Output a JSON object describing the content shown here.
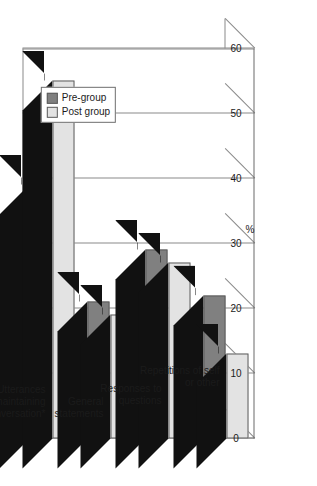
{
  "chart_data": {
    "type": "bar",
    "title": "",
    "subtitle": "",
    "xlabel": "",
    "ylabel": "%",
    "ylim": [
      0,
      60
    ],
    "yticks": [
      0,
      10,
      20,
      30,
      40,
      50,
      60
    ],
    "grid": true,
    "orientation": "rotated-90ccw",
    "legend_position": "upper-center",
    "categories": [
      "Utterances maintaining conversation*",
      "General statements",
      "Responses to questions",
      "Repetitions of self or other"
    ],
    "series": [
      {
        "name": "Pre-group",
        "color": "#808080",
        "values": [
          39,
          21,
          29,
          22
        ]
      },
      {
        "name": "Post group",
        "color": "#e3e3e3",
        "values": [
          55,
          19,
          27,
          13
        ]
      }
    ]
  },
  "legend": {
    "entries": [
      {
        "label": "Pre-group",
        "color": "#808080"
      },
      {
        "label": "Post group",
        "color": "#e3e3e3"
      }
    ]
  },
  "axis": {
    "value_axis_title": "%",
    "tick_labels": [
      "0",
      "10",
      "20",
      "30",
      "40",
      "50",
      "60"
    ]
  },
  "colors": {
    "pre_group": "#808080",
    "post_group": "#e3e3e3",
    "bar_depth": "#111111",
    "frame": "#8a8a8a",
    "text": "#1b1b1b",
    "background": "#ffffff"
  }
}
